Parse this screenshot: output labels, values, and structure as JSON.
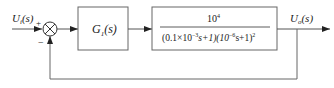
{
  "diagram": {
    "type": "block-diagram",
    "input": {
      "var": "U",
      "sub": "i",
      "arg": "(s)"
    },
    "output": {
      "var": "U",
      "sub": "o",
      "arg": "(s)"
    },
    "summing_junction": {
      "plus_sign": "+",
      "minus_sign": "−"
    },
    "blocks": [
      {
        "id": "G1",
        "var": "G",
        "sub": "1",
        "arg": "(s)"
      },
      {
        "id": "plant",
        "numerator": "10",
        "numerator_exp": "4",
        "denominator_parts": {
          "p1": "(0.1×10",
          "e1": "−3",
          "p2": "s+1)(10",
          "e2": "−6",
          "p3": "s+1)",
          "e3": "2"
        }
      }
    ],
    "feedback": "unity negative feedback",
    "colors": {
      "line": "#555555",
      "text": "#222222"
    }
  }
}
